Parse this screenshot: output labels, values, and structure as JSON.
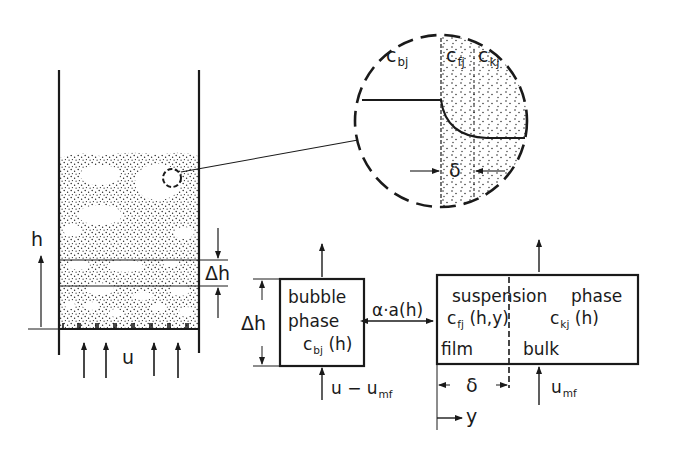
{
  "figure": {
    "type": "fluidized bed two-phase model schematic",
    "colors": {
      "ink": "#1a1a1a",
      "background": "#ffffff",
      "particles": "#2a2a2a"
    }
  },
  "bed": {
    "height_label": "h",
    "slice_label": "Δh",
    "gas_velocity_label": "u"
  },
  "magnifier": {
    "bubble_conc": {
      "base": "c",
      "sub": "bj"
    },
    "film_conc": {
      "base": "c",
      "sub": "fj"
    },
    "bulk_conc": {
      "base": "c",
      "sub": "kj"
    },
    "film_thickness": "δ"
  },
  "model": {
    "bubble_phase": {
      "line1": "bubble",
      "line2": "phase",
      "conc_base": "c",
      "conc_sub": "bj",
      "conc_arg": " (h)",
      "height_label": "Δh",
      "inflow_base": "u − u",
      "inflow_sub": "mf"
    },
    "exchange_label": "α·a(h)",
    "suspension_phase": {
      "title_left": "suspension",
      "title_right": "phase",
      "film_conc_base": "c",
      "film_conc_sub": "fj",
      "film_conc_arg": " (h,y)",
      "bulk_conc_base": "c",
      "bulk_conc_sub": "kj",
      "bulk_conc_arg": " (h)",
      "film_label": "film",
      "bulk_label": "bulk",
      "film_thickness": "δ",
      "coord_label": "y",
      "inflow_base": "u",
      "inflow_sub": "mf"
    }
  }
}
